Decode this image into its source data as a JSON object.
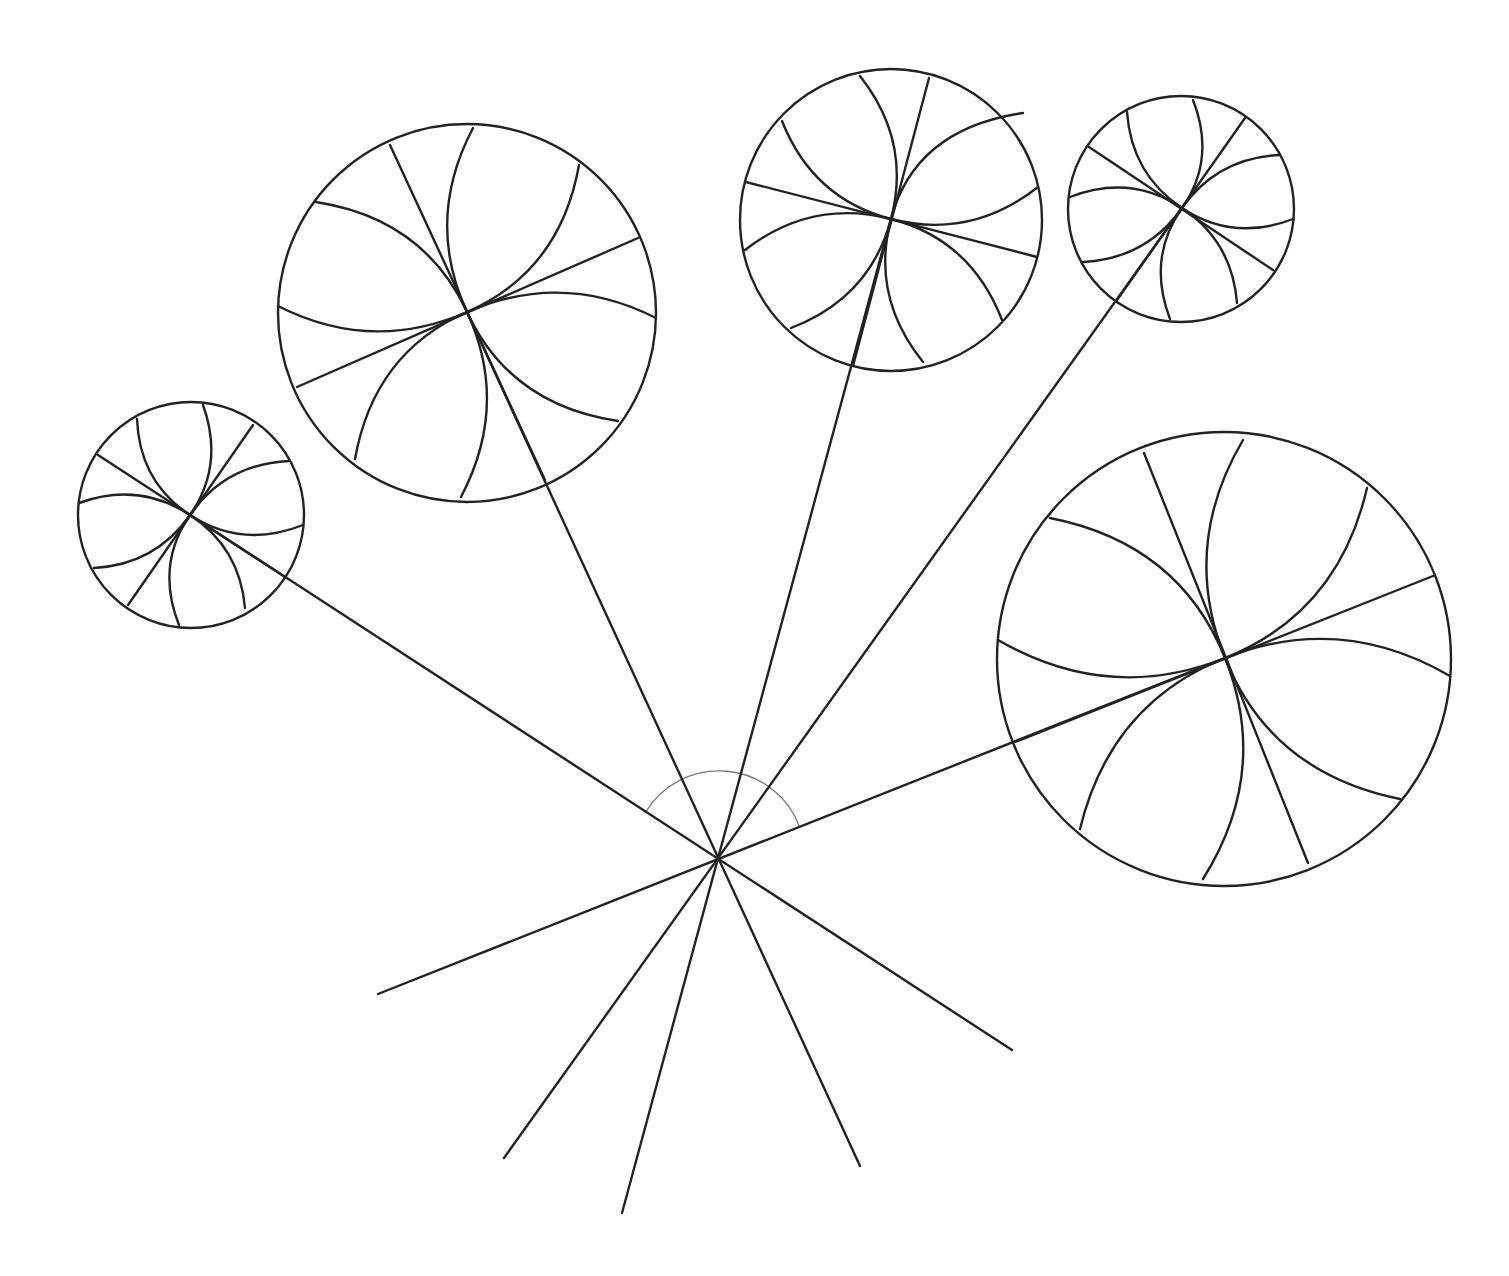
{
  "diagram": {
    "width": 1509,
    "height": 1276,
    "background": "#ffffff",
    "stroke_color": "#222222",
    "angle_arc_color": "#7a7a7a",
    "hub": {
      "x": 718,
      "y": 860
    },
    "angle_arc": {
      "radius": 86,
      "start": [
        645,
        813
      ],
      "end": [
        800,
        828
      ]
    },
    "lines_through_hub": [
      {
        "to_circle": 1,
        "a": [
          190,
          515
        ],
        "b": [
          1012,
          1050
        ]
      },
      {
        "to_circle": 2,
        "a": [
          467,
          312
        ],
        "b": [
          860,
          1166
        ]
      },
      {
        "to_circle": 3,
        "a": [
          891,
          219
        ],
        "b": [
          622,
          1213
        ]
      },
      {
        "to_circle": 4,
        "a": [
          1182,
          208
        ],
        "b": [
          504,
          1158
        ]
      },
      {
        "to_circle": 5,
        "a": [
          1225,
          658
        ],
        "b": [
          378,
          994
        ]
      }
    ],
    "circles": [
      {
        "id": 1,
        "cx": 191,
        "cy": 515,
        "r": 113,
        "focus": [
          190,
          515
        ],
        "straight": [
          [
            [
              98,
              455
            ],
            [
              285,
              577
            ]
          ],
          [
            [
              253,
              425
            ],
            [
              128,
              605
            ]
          ]
        ],
        "curves": [
          [
            [
              137,
              419
            ],
            [
              245,
              608
            ]
          ],
          [
            [
              203,
              405
            ],
            [
              179,
              625
            ]
          ],
          [
            [
              289,
              461
            ],
            [
              94,
              568
            ]
          ],
          [
            [
              79,
              503
            ],
            [
              303,
              525
            ]
          ]
        ]
      },
      {
        "id": 2,
        "cx": 467,
        "cy": 313,
        "r": 189,
        "focus": [
          467,
          312
        ],
        "straight": [
          [
            [
              390,
              145
            ],
            [
              545,
              480
            ]
          ],
          [
            [
              297,
              387
            ],
            [
              638,
              238
            ]
          ]
        ],
        "curves": [
          [
            [
              316,
              202
            ],
            [
              618,
              421
            ]
          ],
          [
            [
              473,
              128
            ],
            [
              461,
              497
            ]
          ],
          [
            [
              579,
              165
            ],
            [
              355,
              459
            ]
          ],
          [
            [
              278,
              306
            ],
            [
              656,
              318
            ]
          ]
        ]
      },
      {
        "id": 3,
        "cx": 891,
        "cy": 220,
        "r": 151,
        "focus": [
          891,
          219
        ],
        "straight": [
          [
            [
              929,
              78
            ],
            [
              853,
              366
            ]
          ],
          [
            [
              746,
              182
            ],
            [
              1037,
              257
            ]
          ]
        ],
        "curves": [
          [
            [
              860,
              76
            ],
            [
              923,
              362
            ]
          ],
          [
            [
              1023,
              113
            ],
            [
              791,
              328
            ]
          ],
          [
            [
              782,
              121
            ],
            [
              1002,
              320
            ]
          ],
          [
            [
              745,
              250
            ],
            [
              1038,
              187
            ]
          ]
        ]
      },
      {
        "id": 4,
        "cx": 1181,
        "cy": 209,
        "r": 113,
        "focus": [
          1182,
          208
        ],
        "straight": [
          [
            [
              1245,
              118
            ],
            [
              1117,
              300
            ]
          ],
          [
            [
              1089,
              147
            ],
            [
              1273,
              270
            ]
          ]
        ],
        "curves": [
          [
            [
              1127,
              112
            ],
            [
              1237,
              303
            ]
          ],
          [
            [
              1193,
              100
            ],
            [
              1170,
              319
            ]
          ],
          [
            [
              1280,
              155
            ],
            [
              1083,
              262
            ]
          ],
          [
            [
              1070,
              197
            ],
            [
              1293,
              219
            ]
          ]
        ]
      },
      {
        "id": 5,
        "cx": 1224,
        "cy": 659,
        "r": 227,
        "focus": [
          1225,
          658
        ],
        "straight": [
          [
            [
              1015,
              742
            ],
            [
              1433,
              576
            ]
          ],
          [
            [
              1144,
              453
            ],
            [
              1308,
              863
            ]
          ]
        ],
        "curves": [
          [
            [
              1050,
              518
            ],
            [
              1400,
              799
            ]
          ],
          [
            [
              1243,
              440
            ],
            [
              1203,
              879
            ]
          ],
          [
            [
              1367,
              488
            ],
            [
              1080,
              829
            ]
          ],
          [
            [
              998,
              640
            ],
            [
              1450,
              676
            ]
          ]
        ]
      }
    ]
  }
}
